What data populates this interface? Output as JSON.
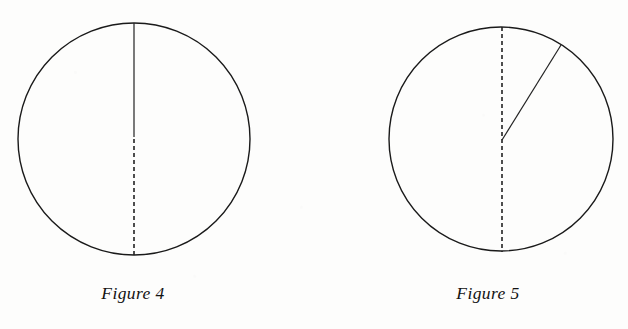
{
  "page": {
    "background_color": "#fdfdfc",
    "ink_color": "#1a1a1a",
    "width": 628,
    "height": 329
  },
  "figures": [
    {
      "id": "figure-4",
      "caption": "Figure 4",
      "caption_center_x": 133,
      "caption_y": 295,
      "circle": {
        "center_x": 134,
        "center_y": 139,
        "radius": 116,
        "stroke_color": "#1a1a1a",
        "stroke_width": 1.4
      },
      "segments": [
        {
          "name": "upper-radius-solid",
          "style": "solid",
          "x1": 134,
          "y1": 23,
          "x2": 134,
          "y2": 137,
          "stroke_color": "#222222",
          "stroke_width": 1.2
        },
        {
          "name": "lower-radius-dashed",
          "style": "dashed",
          "x1": 134,
          "y1": 139,
          "x2": 134,
          "y2": 255,
          "dash_pattern": "4 3",
          "stroke_color": "#222222",
          "stroke_width": 1.6
        }
      ]
    },
    {
      "id": "figure-5",
      "caption": "Figure 5",
      "caption_center_x": 488,
      "caption_y": 295,
      "circle": {
        "center_x": 501,
        "center_y": 139,
        "radius": 112,
        "stroke_color": "#1a1a1a",
        "stroke_width": 1.4
      },
      "segments": [
        {
          "name": "vertical-diameter-dashed",
          "style": "dashed",
          "x1": 502,
          "y1": 27,
          "x2": 502,
          "y2": 252,
          "dash_pattern": "4 3",
          "stroke_color": "#222222",
          "stroke_width": 1.6
        },
        {
          "name": "slanted-radius-solid",
          "style": "solid",
          "x1": 502,
          "y1": 140,
          "x2": 561,
          "y2": 45,
          "stroke_color": "#222222",
          "stroke_width": 1.2
        }
      ]
    }
  ]
}
